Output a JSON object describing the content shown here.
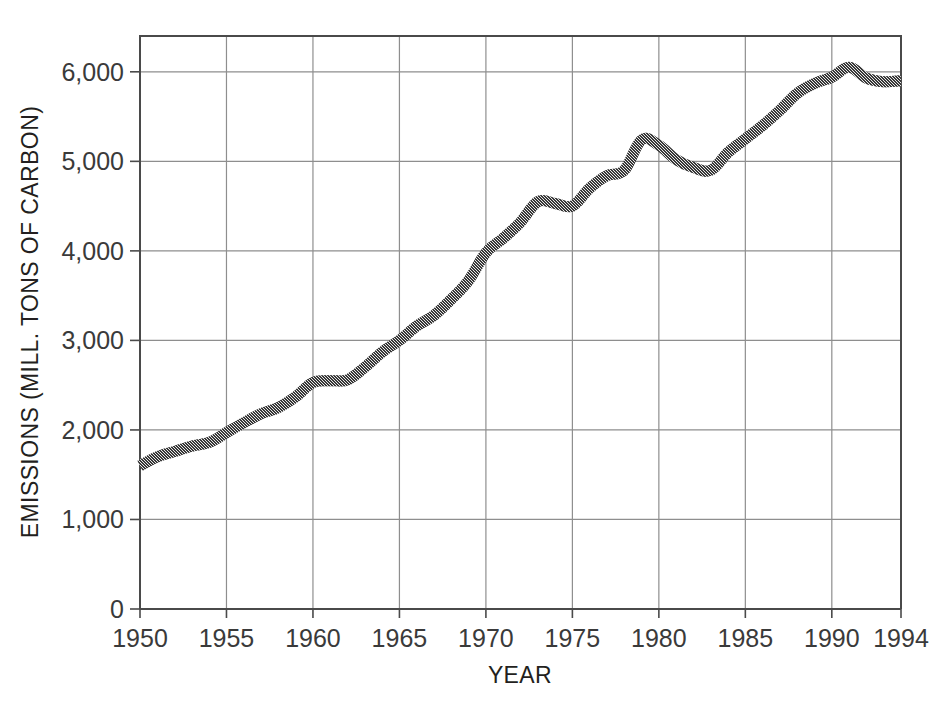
{
  "chart_data": {
    "type": "line",
    "title": "",
    "subtitle": "",
    "xlabel": "YEAR",
    "ylabel": "EMISSIONS (MILL. TONS OF CARBON)",
    "xlim": [
      1950,
      1994
    ],
    "ylim": [
      0,
      6400
    ],
    "grid": true,
    "legend": null,
    "legend_position": "none",
    "x_ticks": [
      1950,
      1955,
      1960,
      1965,
      1970,
      1975,
      1980,
      1985,
      1990,
      1994
    ],
    "x_tick_labels": [
      "1950",
      "1955",
      "1960",
      "1965",
      "1970",
      "1975",
      "1980",
      "1985",
      "1990",
      "1994"
    ],
    "y_ticks": [
      0,
      1000,
      2000,
      3000,
      4000,
      5000,
      6000
    ],
    "y_tick_labels": [
      "0",
      "1,000",
      "2,000",
      "3,000",
      "4,000",
      "5,000",
      "6,000"
    ],
    "series_color": "#5a5a5a",
    "x": [
      1950,
      1951,
      1952,
      1953,
      1954,
      1955,
      1956,
      1957,
      1958,
      1959,
      1960,
      1961,
      1962,
      1963,
      1964,
      1965,
      1966,
      1967,
      1968,
      1969,
      1970,
      1971,
      1972,
      1973,
      1974,
      1975,
      1976,
      1977,
      1978,
      1979,
      1980,
      1981,
      1982,
      1983,
      1984,
      1985,
      1986,
      1987,
      1988,
      1989,
      1990,
      1991,
      1992,
      1993,
      1994
    ],
    "values": [
      1600,
      1700,
      1760,
      1820,
      1860,
      1970,
      2080,
      2180,
      2250,
      2370,
      2530,
      2550,
      2560,
      2700,
      2870,
      3000,
      3160,
      3280,
      3460,
      3670,
      3980,
      4140,
      4320,
      4550,
      4530,
      4500,
      4700,
      4840,
      4900,
      5240,
      5180,
      5020,
      4930,
      4900,
      5100,
      5250,
      5400,
      5570,
      5760,
      5870,
      5940,
      6050,
      5930,
      5890,
      5900
    ],
    "series": [
      {
        "name": "Global carbon emissions",
        "values": [
          1600,
          1700,
          1760,
          1820,
          1860,
          1970,
          2080,
          2180,
          2250,
          2370,
          2530,
          2550,
          2560,
          2700,
          2870,
          3000,
          3160,
          3280,
          3460,
          3670,
          3980,
          4140,
          4320,
          4550,
          4530,
          4500,
          4700,
          4840,
          4900,
          5240,
          5180,
          5020,
          4930,
          4900,
          5100,
          5250,
          5400,
          5570,
          5760,
          5870,
          5940,
          6050,
          5930,
          5890,
          5900
        ]
      }
    ]
  }
}
